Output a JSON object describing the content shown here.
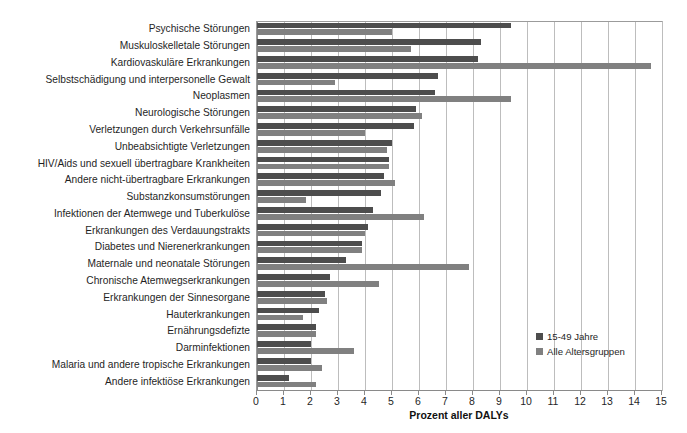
{
  "chart_data": {
    "type": "bar",
    "orientation": "horizontal",
    "title": "",
    "xlabel": "Prozent aller DALYs",
    "ylabel": "",
    "xlim": [
      0,
      15
    ],
    "xticks": [
      0,
      1,
      2,
      3,
      4,
      5,
      6,
      7,
      8,
      9,
      10,
      11,
      12,
      13,
      14,
      15
    ],
    "grid": true,
    "legend_position": "inside-right-bottom",
    "categories": [
      "Psychische Störungen",
      "Muskuloskelletale Störungen",
      "Kardiovaskuläre Erkrankungen",
      "Selbstschädigung und interpersonelle Gewalt",
      "Neoplasmen",
      "Neurologische Störungen",
      "Verletzungen durch Verkehrsunfälle",
      "Unbeabsichtigte Verletzungen",
      "HIV/Aids und sexuell übertragbare Krankheiten",
      "Andere nicht-übertragbare Erkrankungen",
      "Substanzkonsumstörungen",
      "Infektionen der Atemwege und Tuberkulöse",
      "Erkrankungen des Verdauungstrakts",
      "Diabetes und Nierenerkrankungen",
      "Maternale und neonatale Störungen",
      "Chronische Atemwegserkrankungen",
      "Erkrankungen der Sinnesorgane",
      "Hauterkrankungen",
      "Ernährungsdefizte",
      "Darminfektionen",
      "Malaria und andere tropische Erkrankungen",
      "Andere infektiöse Erkrankungen"
    ],
    "series": [
      {
        "name": "15-49 Jahre",
        "color": "#4d4d4d",
        "values": [
          9.4,
          8.3,
          8.2,
          6.7,
          6.6,
          5.9,
          5.8,
          5.0,
          4.9,
          4.7,
          4.6,
          4.3,
          4.1,
          3.9,
          3.3,
          2.7,
          2.5,
          2.3,
          2.2,
          2.0,
          2.0,
          1.2
        ]
      },
      {
        "name": "Alle Altersgruppen",
        "color": "#808080",
        "values": [
          5.0,
          5.7,
          14.6,
          2.9,
          9.4,
          6.1,
          4.0,
          4.8,
          4.9,
          5.1,
          1.8,
          6.2,
          4.0,
          3.9,
          7.85,
          4.5,
          2.6,
          1.7,
          2.2,
          3.6,
          2.4,
          2.2
        ]
      }
    ]
  },
  "legend": {
    "items": [
      {
        "label": "15-49 Jahre",
        "color": "#4d4d4d"
      },
      {
        "label": "Alle Altersgruppen",
        "color": "#808080"
      }
    ]
  }
}
